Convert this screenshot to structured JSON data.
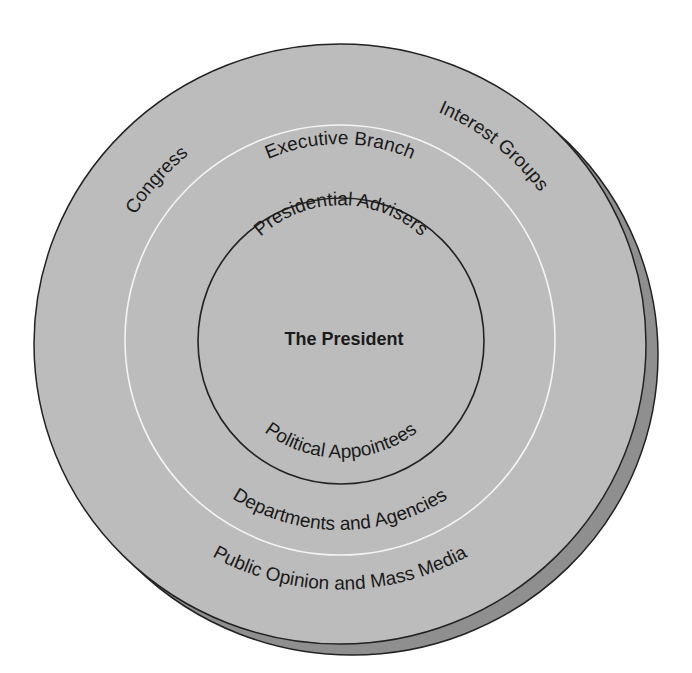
{
  "diagram": {
    "colors": {
      "background": "#ffffff",
      "disc_fill": "#bcbcbc",
      "disc_rim": "#8f8f8f",
      "outline": "#222222",
      "ring_divider": "#f4f4f4",
      "text": "#1a1a1a"
    },
    "outer_ring": {
      "labels": {
        "congress": "Congress",
        "interest_groups": "Interest Groups",
        "public_opinion": "Public Opinion and Mass Media"
      }
    },
    "middle_ring": {
      "labels": {
        "executive_branch": "Executive Branch",
        "departments": "Departments and Agencies"
      }
    },
    "inner_circle": {
      "labels": {
        "advisers": "Presidential Advisers",
        "appointees": "Political Appointees"
      }
    },
    "center": {
      "label": "The President"
    }
  }
}
